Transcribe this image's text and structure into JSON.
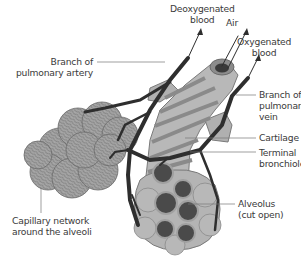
{
  "diagram": {
    "labels": {
      "deoxygenated_blood": [
        "Deoxygenated",
        "blood"
      ],
      "air": [
        "Air"
      ],
      "oxygenated_blood": [
        "Oxygenated",
        "blood"
      ],
      "branch_pulmonary_artery": [
        "Branch of",
        "pulmonary artery"
      ],
      "branch_pulmonary_vein": [
        "Branch of",
        "pulmonary",
        "vein"
      ],
      "cartilage": [
        "Cartilage"
      ],
      "terminal_bronchiole": [
        "Terminal",
        "bronchiole"
      ],
      "capillary_network": [
        "Capillary network",
        "around the alveoli"
      ],
      "alveolus": [
        "Alveolus",
        "(cut open)"
      ]
    },
    "colors": {
      "vessel": "#2e2e2e",
      "tissue_light": "#b4b4b4",
      "tissue_mid": "#9a9a9a",
      "alveolus_interior": "#4a4a4a",
      "leader_line": "#666666",
      "text": "#3a3a3a"
    }
  }
}
